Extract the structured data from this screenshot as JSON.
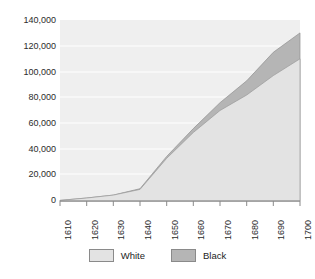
{
  "chart_data": {
    "type": "area",
    "stacked": true,
    "title": "",
    "subtitle": "",
    "xlabel": "",
    "ylabel": "",
    "grid": true,
    "legend_position": "bottom",
    "x": [
      1610,
      1620,
      1630,
      1640,
      1650,
      1660,
      1670,
      1680,
      1690,
      1700
    ],
    "xlim": [
      1610,
      1700
    ],
    "ylim": [
      0,
      140000
    ],
    "ytick_values": [
      0,
      20000,
      40000,
      60000,
      80000,
      100000,
      120000,
      140000
    ],
    "ytick_labels": [
      "0",
      "20,000",
      "40,000",
      "60,000",
      "80,000",
      "100,000",
      "120,000",
      "140,000"
    ],
    "xtick_labels": [
      "1610",
      "1620",
      "1630",
      "1640",
      "1650",
      "1660",
      "1670",
      "1680",
      "1690",
      "1700"
    ],
    "series": [
      {
        "name": "White",
        "color": "#e3e3e3",
        "values": [
          350,
          2300,
          4600,
          13700,
          48800,
          72100,
          107400,
          144500,
          194000,
          223000
        ]
      },
      {
        "name": "Black",
        "color": "#b5b5b5",
        "values": [
          0,
          20,
          60,
          600,
          1600,
          2900,
          4500,
          7000,
          13000,
          20000
        ]
      }
    ],
    "series_plotted": [
      {
        "name": "White",
        "color": "#e3e3e3",
        "values": [
          500,
          2300,
          4600,
          9000,
          33000,
          53000,
          70000,
          82000,
          97000,
          110000
        ]
      },
      {
        "name": "Black",
        "color": "#b5b5b5",
        "values": [
          0,
          0,
          0,
          500,
          1500,
          3000,
          6000,
          11000,
          18000,
          20000
        ]
      }
    ]
  },
  "legend": {
    "items": [
      {
        "label": "White",
        "color": "#e3e3e3"
      },
      {
        "label": "Black",
        "color": "#b5b5b5"
      }
    ]
  },
  "axis": {
    "y_ticks": [
      "140,000",
      "120,000",
      "100,000",
      "80,000",
      "60,000",
      "40,000",
      "20,000",
      "0"
    ],
    "x_ticks": [
      "1610",
      "1620",
      "1630",
      "1640",
      "1650",
      "1660",
      "1670",
      "1680",
      "1690",
      "1700"
    ]
  }
}
